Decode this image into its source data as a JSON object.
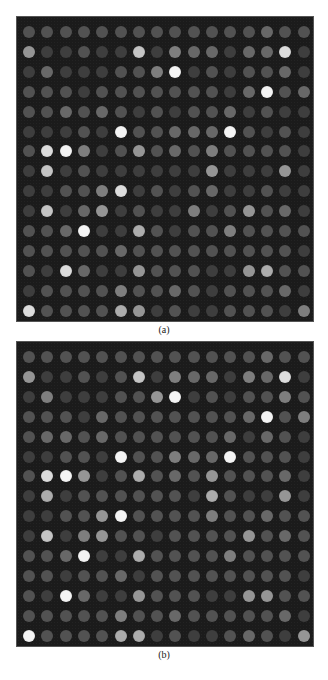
{
  "figure": {
    "panels": [
      {
        "label": "(a)",
        "rows": 15,
        "cols": 16,
        "intensity_scale": "0-9",
        "grid": [
          [
            2,
            2,
            2,
            2,
            2,
            2,
            2,
            2,
            2,
            2,
            2,
            2,
            2,
            3,
            2,
            2
          ],
          [
            5,
            1,
            1,
            2,
            1,
            1,
            7,
            1,
            4,
            3,
            3,
            1,
            3,
            3,
            8,
            1
          ],
          [
            1,
            3,
            1,
            1,
            1,
            2,
            2,
            4,
            9,
            1,
            2,
            1,
            2,
            2,
            3,
            1
          ],
          [
            2,
            2,
            2,
            1,
            2,
            2,
            2,
            2,
            2,
            2,
            2,
            1,
            3,
            9,
            2,
            3
          ],
          [
            2,
            2,
            3,
            2,
            3,
            2,
            1,
            2,
            1,
            2,
            2,
            3,
            1,
            2,
            1,
            1
          ],
          [
            1,
            1,
            1,
            2,
            1,
            9,
            2,
            2,
            3,
            3,
            3,
            9,
            2,
            1,
            2,
            1
          ],
          [
            2,
            8,
            9,
            4,
            1,
            2,
            5,
            2,
            3,
            2,
            4,
            2,
            2,
            2,
            2,
            1
          ],
          [
            1,
            7,
            1,
            2,
            1,
            1,
            1,
            1,
            1,
            1,
            5,
            1,
            1,
            1,
            5,
            1
          ],
          [
            1,
            1,
            2,
            2,
            4,
            8,
            1,
            2,
            1,
            2,
            3,
            1,
            1,
            2,
            1,
            1
          ],
          [
            1,
            7,
            1,
            3,
            5,
            1,
            2,
            1,
            1,
            4,
            1,
            2,
            5,
            2,
            3,
            1
          ],
          [
            2,
            2,
            3,
            9,
            1,
            1,
            6,
            2,
            1,
            2,
            2,
            4,
            2,
            2,
            2,
            2
          ],
          [
            2,
            2,
            2,
            2,
            2,
            3,
            2,
            2,
            2,
            2,
            2,
            2,
            2,
            2,
            2,
            1
          ],
          [
            2,
            1,
            8,
            3,
            1,
            1,
            5,
            2,
            2,
            2,
            1,
            1,
            5,
            6,
            2,
            2
          ],
          [
            1,
            2,
            2,
            2,
            2,
            4,
            2,
            2,
            3,
            2,
            1,
            2,
            2,
            2,
            3,
            1
          ],
          [
            8,
            2,
            2,
            2,
            2,
            6,
            5,
            1,
            2,
            1,
            1,
            2,
            2,
            2,
            1,
            4
          ]
        ]
      },
      {
        "label": "(b)",
        "rows": 15,
        "cols": 16,
        "intensity_scale": "0-9",
        "grid": [
          [
            2,
            2,
            2,
            2,
            2,
            2,
            2,
            2,
            2,
            2,
            2,
            2,
            2,
            3,
            2,
            2
          ],
          [
            5,
            1,
            1,
            2,
            1,
            2,
            7,
            1,
            4,
            3,
            3,
            1,
            4,
            3,
            8,
            1
          ],
          [
            1,
            4,
            1,
            1,
            1,
            2,
            2,
            5,
            9,
            1,
            2,
            1,
            2,
            2,
            4,
            2
          ],
          [
            2,
            2,
            2,
            1,
            3,
            2,
            2,
            2,
            2,
            2,
            2,
            2,
            3,
            9,
            2,
            4
          ],
          [
            2,
            3,
            3,
            2,
            3,
            2,
            2,
            2,
            2,
            2,
            2,
            3,
            1,
            3,
            2,
            1
          ],
          [
            1,
            1,
            2,
            2,
            1,
            9,
            2,
            2,
            4,
            3,
            3,
            9,
            2,
            2,
            2,
            1
          ],
          [
            2,
            8,
            9,
            5,
            1,
            2,
            6,
            2,
            3,
            2,
            5,
            2,
            2,
            2,
            3,
            1
          ],
          [
            1,
            6,
            1,
            2,
            2,
            2,
            2,
            2,
            2,
            1,
            6,
            2,
            1,
            1,
            5,
            1
          ],
          [
            1,
            1,
            2,
            2,
            5,
            9,
            2,
            2,
            2,
            2,
            4,
            2,
            2,
            3,
            2,
            2
          ],
          [
            1,
            7,
            1,
            4,
            5,
            2,
            2,
            1,
            2,
            2,
            2,
            2,
            5,
            2,
            3,
            2
          ],
          [
            2,
            2,
            3,
            9,
            1,
            1,
            6,
            2,
            2,
            2,
            2,
            4,
            2,
            2,
            2,
            2
          ],
          [
            2,
            2,
            1,
            2,
            2,
            3,
            1,
            2,
            2,
            2,
            2,
            2,
            2,
            2,
            2,
            1
          ],
          [
            2,
            1,
            9,
            3,
            1,
            1,
            5,
            2,
            2,
            2,
            1,
            1,
            5,
            5,
            2,
            2
          ],
          [
            2,
            2,
            2,
            2,
            2,
            4,
            2,
            2,
            3,
            2,
            2,
            2,
            2,
            2,
            3,
            1
          ],
          [
            9,
            2,
            2,
            2,
            2,
            6,
            6,
            1,
            2,
            1,
            1,
            2,
            3,
            2,
            1,
            5
          ]
        ]
      }
    ],
    "colors": {
      "background": "#1b1b1b",
      "spot_min": "#2c2c2c",
      "spot_max": "#f4f4f4"
    }
  }
}
